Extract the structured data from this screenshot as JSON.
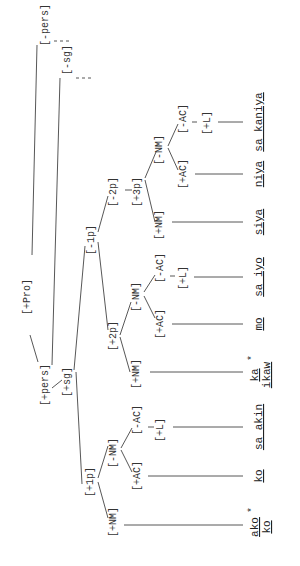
{
  "diagram": {
    "type": "feature-tree",
    "orientation": "rotated-90-ccw",
    "root": "[+Pro]",
    "nodes": {
      "pro": "[+Pro]",
      "plus_pers": "[+pers]",
      "minus_pers": "[-pers]",
      "plus_sg": "[+sg]",
      "minus_sg": "[-sg]",
      "plus_1p": "[+1p]",
      "minus_1p": "[-1p]",
      "plus_2p": "[+2p]",
      "minus_2p": "[-2p]",
      "plus_3p": "[+3p]",
      "p1_plus_nm": "[+NM]",
      "p1_minus_nm": "[-NM]",
      "p1_plus_ac": "[+AC]",
      "p1_minus_ac": "[-AC]",
      "p1_plus_l": "[+L]",
      "p2_plus_nm": "[+NM]",
      "p2_minus_nm": "[-NM]",
      "p2_plus_ac": "[+AC]",
      "p2_minus_ac": "[-AC]",
      "p2_plus_l": "[+L]",
      "p3_plus_nm": "[+NM]",
      "p3_minus_nm": "[-NM]",
      "p3_plus_ac": "[+AC]",
      "p3_minus_ac": "[-AC]",
      "p3_plus_l": "[+L]"
    },
    "leaves": {
      "ako": "ako",
      "ako_star": "*",
      "ako_ko": "ko",
      "ko": "ko",
      "sa_akin": "sa akin",
      "ka": "ka",
      "ka_star": "*",
      "ikaw": "ikaw",
      "mo": "mo",
      "sa_iyo": "sa iyo",
      "siya": "siya",
      "niya": "niya",
      "sa_kaniya": "sa kaniya"
    }
  }
}
